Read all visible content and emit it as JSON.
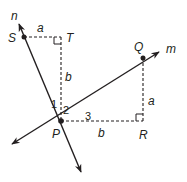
{
  "diagram": {
    "lines": [
      {
        "name": "n",
        "label": "n"
      },
      {
        "name": "m",
        "label": "m"
      }
    ],
    "points": {
      "S": {
        "label": "S"
      },
      "T": {
        "label": "T"
      },
      "Q": {
        "label": "Q"
      },
      "P": {
        "label": "P"
      },
      "R": {
        "label": "R"
      }
    },
    "segment_labels": {
      "ST": "a",
      "TP": "b",
      "PR": "b",
      "QR": "a"
    },
    "angles": {
      "angle1": "1",
      "angle2": "2",
      "angle3": "3"
    },
    "colors": {
      "stroke": "#231f20",
      "background": "#ffffff"
    }
  }
}
